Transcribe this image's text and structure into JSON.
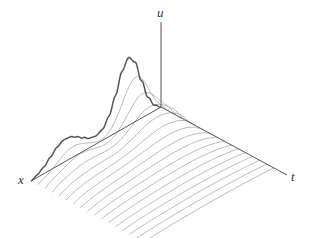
{
  "chart_data": {
    "type": "surface-waterfall",
    "title": "",
    "axes": {
      "x_label": "x",
      "t_label": "t",
      "u_label": "u"
    },
    "initial_profile": {
      "x": [
        0.0,
        0.05,
        0.1,
        0.15,
        0.2,
        0.25,
        0.3,
        0.35,
        0.4,
        0.45,
        0.5,
        0.55,
        0.6,
        0.65,
        0.7,
        0.75,
        0.8,
        0.85,
        0.9,
        0.95,
        1.0
      ],
      "u": [
        0.0,
        0.08,
        0.25,
        0.55,
        0.88,
        1.0,
        0.85,
        0.55,
        0.3,
        0.16,
        0.12,
        0.14,
        0.2,
        0.27,
        0.32,
        0.33,
        0.28,
        0.19,
        0.1,
        0.04,
        0.0
      ]
    },
    "num_time_slices": 16,
    "t_range": [
      0,
      1
    ],
    "x_range": [
      0,
      1
    ],
    "u_range": [
      0,
      1
    ],
    "colors": {
      "axis": "#555555",
      "initial_curve": "#555555",
      "slice_lines": "#bbbbbb",
      "label": "#333333"
    }
  },
  "projection": {
    "origin": [
      161,
      107
    ],
    "x_end": [
      31,
      181
    ],
    "t_end": [
      287,
      175
    ],
    "u_top": [
      161,
      22
    ],
    "u_scale_px": 68
  },
  "labels": {
    "x": "x",
    "t": "t",
    "u": "u"
  }
}
